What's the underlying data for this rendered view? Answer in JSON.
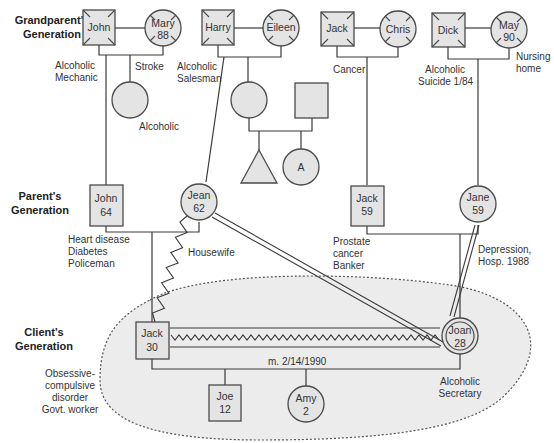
{
  "generations": {
    "grandparents": [
      "Grandparent's",
      "Generation"
    ],
    "parents": [
      "Parent's",
      "Generation"
    ],
    "client": [
      "Client's",
      "Generation"
    ]
  },
  "people": {
    "john_gp": {
      "name": "John",
      "age": "",
      "sex": "male",
      "deceased": true
    },
    "mary_gp": {
      "name": "Mary",
      "age": "88",
      "sex": "female",
      "deceased": true
    },
    "harry_gp": {
      "name": "Harry",
      "age": "",
      "sex": "male",
      "deceased": true
    },
    "eileen_gp": {
      "name": "Eileen",
      "age": "",
      "sex": "female",
      "deceased": true
    },
    "jack_gp": {
      "name": "Jack",
      "age": "",
      "sex": "male",
      "deceased": true
    },
    "chris_gp": {
      "name": "Chris",
      "age": "",
      "sex": "female",
      "deceased": true
    },
    "dick_gp": {
      "name": "Dick",
      "age": "",
      "sex": "male",
      "deceased": true
    },
    "may_gp": {
      "name": "May",
      "age": "90",
      "sex": "female",
      "deceased": true
    },
    "aunt_1": {
      "name": "",
      "sex": "female"
    },
    "uncle_in_law": {
      "name": "",
      "sex": "male"
    },
    "cousin_triangle": {
      "name": "",
      "sex": "unknown"
    },
    "cousin_a": {
      "name": "A",
      "sex": "female"
    },
    "john_p": {
      "name": "John",
      "age": "64",
      "sex": "male"
    },
    "jean_p": {
      "name": "Jean",
      "age": "62",
      "sex": "female"
    },
    "jack_p": {
      "name": "Jack",
      "age": "59",
      "sex": "male"
    },
    "jane_p": {
      "name": "Jane",
      "age": "59",
      "sex": "female"
    },
    "jack_c": {
      "name": "Jack",
      "age": "30",
      "sex": "male"
    },
    "joan_c": {
      "name": "Joan",
      "age": "28",
      "sex": "female",
      "index_client": true
    },
    "joe_c": {
      "name": "Joe",
      "age": "12",
      "sex": "male"
    },
    "amy_c": {
      "name": "Amy",
      "age": "2",
      "sex": "female"
    }
  },
  "annotations": {
    "john_gp": [
      "Alcoholic",
      "Mechanic"
    ],
    "mary_gp": [
      "Stroke"
    ],
    "harry_gp": [
      "Alcoholic",
      "Salesman"
    ],
    "aunt_1": [
      "Alcoholic"
    ],
    "jack_gp": [
      "Cancer"
    ],
    "dick_gp": [
      "Alcoholic",
      "Suicide 1/84"
    ],
    "may_gp": [
      "Nursing",
      "home"
    ],
    "john_p": [
      "Heart disease",
      "Diabetes",
      "Policeman"
    ],
    "jean_p": [
      "Housewife"
    ],
    "jack_p": [
      "Prostate",
      "cancer",
      "Banker"
    ],
    "jane_p": [
      "Depression,",
      "Hosp. 1988"
    ],
    "jack_c": [
      "Obsessive-",
      "compulsive",
      "disorder",
      "Govt. worker"
    ],
    "joan_c": [
      "Alcoholic",
      "Secretary"
    ],
    "marriage": "m. 2/14/1990"
  },
  "relationships": [
    {
      "from": "Jean",
      "to": "Jack (30)",
      "type": "conflictual"
    },
    {
      "from": "Jack (30)",
      "to": "Joan",
      "type": "close-conflictual"
    },
    {
      "from": "Jean",
      "to": "Joan",
      "type": "close"
    },
    {
      "from": "Jane",
      "to": "Joan",
      "type": "close"
    }
  ],
  "colors": {
    "fill": "#e4e4e4",
    "stroke": "#4a4a4a",
    "household": "#ececec"
  }
}
